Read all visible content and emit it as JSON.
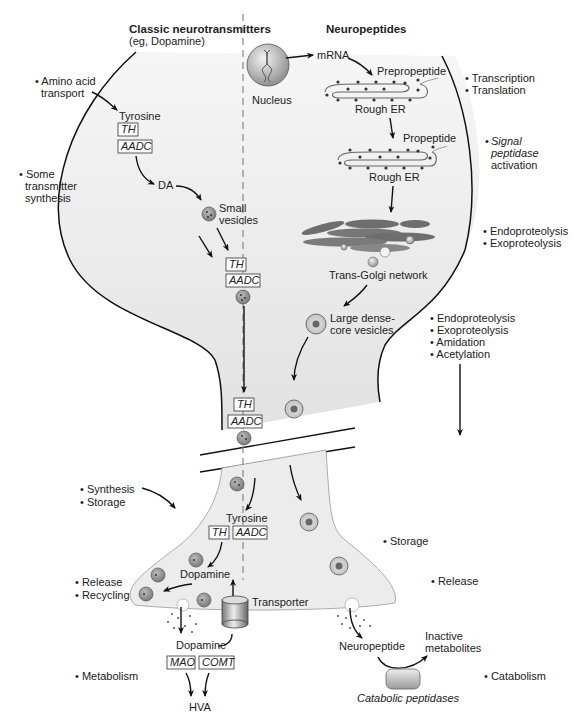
{
  "headers": {
    "classic_title": "Classic neurotransmitters",
    "classic_subtitle": "(eg, Dopamine)",
    "neuropeptides_title": "Neuropeptides"
  },
  "left_annotations": {
    "amino_acid_transport_1": "• Amino acid",
    "amino_acid_transport_2": "transport",
    "some_synthesis_1": "• Some",
    "some_synthesis_2": "transmitter",
    "some_synthesis_3": "synthesis",
    "synthesis": "• Synthesis",
    "storage": "• Storage",
    "release": "• Release",
    "recycling": "• Recycling",
    "metabolism": "• Metabolism"
  },
  "right_annotations": {
    "transcription": "• Transcription",
    "translation": "• Translation",
    "signal_1": "Signal",
    "signal_2": "peptidase",
    "signal_3": "activation",
    "signal_bullet": "•",
    "endo1": "• Endoproteolysis",
    "exo1": "• Exoproteolysis",
    "endo2": "• Endoproteolysis",
    "exo2": "• Exoproteolysis",
    "amidation": "• Amidation",
    "acetylation": "• Acetylation",
    "storage": "• Storage",
    "release": "• Release",
    "catabolism": "• Catabolism"
  },
  "classic_pathway": {
    "tyrosine": "Tyrosine",
    "th": "TH",
    "aadc": "AADC",
    "da": "DA",
    "small_vesicles_1": "Small",
    "small_vesicles_2": "vesicles",
    "axon_th": "TH",
    "axon_aadc": "AADC",
    "mid_th": "TH",
    "mid_aadc": "AADC",
    "terminal_tyrosine": "Tyrosine",
    "terminal_th": "TH",
    "terminal_aadc": "AADC",
    "terminal_dopamine": "Dopamine",
    "transporter": "Transporter",
    "extracellular_dopamine": "Dopamine",
    "mao": "MAO",
    "comt": "COMT",
    "hva": "HVA"
  },
  "peptide_pathway": {
    "nucleus": "Nucleus",
    "mrna": "mRNA",
    "prepropeptide": "Prepropeptide",
    "rough_er_1": "Rough ER",
    "propeptide": "Propeptide",
    "rough_er_2": "Rough ER",
    "trans_golgi": "Trans-Golgi network",
    "ldcv_1": "Large dense-",
    "ldcv_2": "core vesicles",
    "neuropeptide": "Neuropeptide",
    "inactive_1": "Inactive",
    "inactive_2": "metabolites",
    "catabolic_peptidases": "Catabolic peptidases"
  },
  "colors": {
    "cell_fill": "#e8e8e8",
    "outline": "#111111",
    "golgi": "#6e6e6e",
    "vesicle": "#9a9a9a"
  }
}
